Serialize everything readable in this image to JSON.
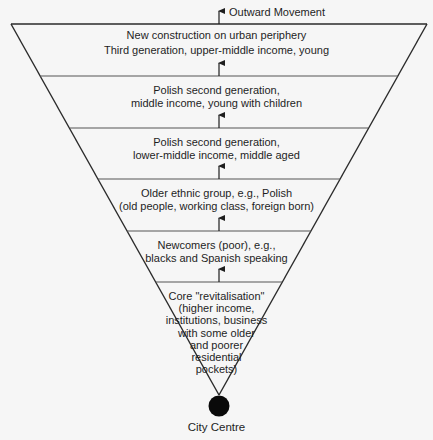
{
  "diagram": {
    "title_arrow_label": "Outward Movement",
    "center_label": "City Centre",
    "colors": {
      "background": "#f6f6f6",
      "outline": "#2a2a2a",
      "divider": "#555555",
      "text": "#1e1e1e",
      "center_dot": "#0a0a0a"
    },
    "zones": [
      {
        "order": 1,
        "label": "New construction on urban periphery",
        "sublabel": "Third generation, upper-middle income, young"
      },
      {
        "order": 2,
        "label": "Polish second generation,\nmiddle income, young with children"
      },
      {
        "order": 3,
        "label": "Polish second generation,\nlower-middle income, middle aged"
      },
      {
        "order": 4,
        "label": "Older ethnic group, e.g., Polish\n(old people, working class, foreign born)"
      },
      {
        "order": 5,
        "label": "Newcomers (poor), e.g.,\nblacks and Spanish speaking"
      },
      {
        "order": 6,
        "label": "Core \"revitalisation\"\n(higher income,\ninstitutions, business\nwith some older\nand poorer\nresidential\npockets)"
      }
    ]
  }
}
